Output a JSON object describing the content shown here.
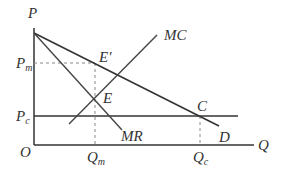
{
  "diagram": {
    "axes": {
      "y_label": "P",
      "x_label": "Q",
      "origin_label": "O"
    },
    "price_labels": {
      "pm_main": "P",
      "pm_sub": "m",
      "pc_main": "P",
      "pc_sub": "c"
    },
    "quantity_labels": {
      "qm_main": "Q",
      "qm_sub": "m",
      "qc_main": "Q",
      "qc_sub": "c"
    },
    "curves": {
      "demand": "D",
      "marginal_revenue": "MR",
      "marginal_cost": "MC",
      "competitive_price_line": "Pc"
    },
    "points": {
      "e_prime": "E′",
      "e": "E",
      "c": "C"
    },
    "colors": {
      "line": "#333333",
      "dashed": "#888888",
      "background": "#ffffff"
    }
  }
}
